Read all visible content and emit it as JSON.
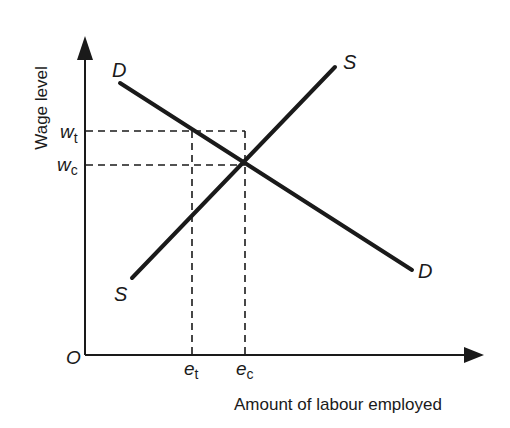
{
  "axes": {
    "y_label": "Wage level",
    "x_label": "Amount of labour employed",
    "origin": "O"
  },
  "curves": {
    "demand": {
      "start_label": "D",
      "end_label": "D"
    },
    "supply": {
      "start_label": "S",
      "end_label": "S"
    }
  },
  "y_ticks": [
    {
      "base": "w",
      "sub": "t"
    },
    {
      "base": "w",
      "sub": "c"
    }
  ],
  "x_ticks": [
    {
      "base": "e",
      "sub": "t"
    },
    {
      "base": "e",
      "sub": "c"
    }
  ],
  "colors": {
    "line": "#1a1a1a",
    "background": "#ffffff"
  }
}
